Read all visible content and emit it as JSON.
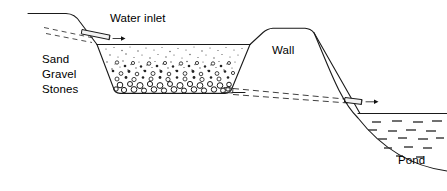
{
  "diagram": {
    "labels": {
      "water_inlet": "Water inlet",
      "wall": "Wall",
      "pond": "Pond",
      "media_sand": "Sand",
      "media_gravel": "Gravel",
      "media_stones": "Stones"
    },
    "icons": {
      "inlet_arrow": "arrow-right-icon",
      "outlet_arrow": "arrow-right-icon",
      "inlet_pipe": "pipe-icon",
      "outlet_pipe": "pipe-icon"
    },
    "colors": {
      "stroke": "#1a1a1a",
      "text": "#000000",
      "background": "#ffffff",
      "grain_fill": "#4a4a4a",
      "water_mark": "#333333"
    },
    "components": [
      {
        "name": "ground-line-left",
        "kind": "terrain"
      },
      {
        "name": "seepage-dashed-upper-left",
        "kind": "flow-line"
      },
      {
        "name": "inlet-pipe",
        "kind": "pipe"
      },
      {
        "name": "filter-basin",
        "kind": "basin"
      },
      {
        "name": "filter-media-sand",
        "kind": "media-layer"
      },
      {
        "name": "filter-media-gravel",
        "kind": "media-layer"
      },
      {
        "name": "filter-media-stones",
        "kind": "media-layer"
      },
      {
        "name": "embankment-wall",
        "kind": "wall"
      },
      {
        "name": "seepage-dashed-lower",
        "kind": "flow-line"
      },
      {
        "name": "outlet-pipe",
        "kind": "pipe"
      },
      {
        "name": "pond-water-surface",
        "kind": "water"
      },
      {
        "name": "pond-bed-curve",
        "kind": "terrain"
      }
    ]
  }
}
